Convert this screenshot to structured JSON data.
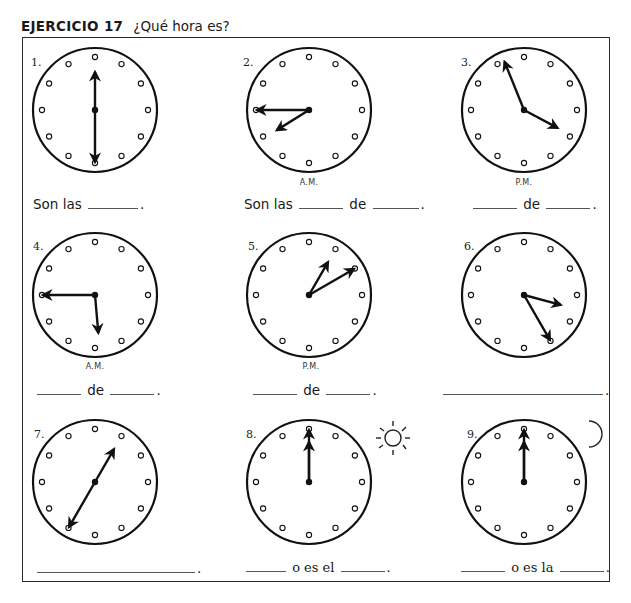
{
  "header": {
    "exercise_label": "EJERCICIO 17",
    "question": "¿Qué hora es?"
  },
  "clocks": [
    {
      "number": "1.",
      "hour_hand_deg": 0,
      "minute_hand_deg": 180,
      "period": "",
      "time_shown": "6:00",
      "answer": {
        "prefix": "Son las",
        "middle": "",
        "suffix": "."
      }
    },
    {
      "number": "2.",
      "hour_hand_deg": 238,
      "minute_hand_deg": 270,
      "period": "A.M.",
      "time_shown": "7:45",
      "answer": {
        "prefix": "Son las",
        "middle": "de",
        "suffix": "."
      }
    },
    {
      "number": "3.",
      "hour_hand_deg": 118,
      "minute_hand_deg": 338,
      "period": "P.M.",
      "time_shown": "3:55 / 4:55 region",
      "answer": {
        "prefix": "",
        "middle": "de",
        "suffix": "."
      }
    },
    {
      "number": "4.",
      "hour_hand_deg": 175,
      "minute_hand_deg": 270,
      "period": "A.M.",
      "time_shown": "5:45",
      "answer": {
        "prefix": "",
        "middle": "de",
        "suffix": "."
      }
    },
    {
      "number": "5.",
      "hour_hand_deg": 30,
      "minute_hand_deg": 60,
      "period": "P.M.",
      "time_shown": "1:10",
      "answer": {
        "prefix": "",
        "middle": "de",
        "suffix": "."
      }
    },
    {
      "number": "6.",
      "hour_hand_deg": 105,
      "minute_hand_deg": 150,
      "period": "",
      "time_shown": "3:25",
      "answer": {
        "prefix": "",
        "middle": "",
        "suffix": "."
      }
    },
    {
      "number": "7.",
      "hour_hand_deg": 30,
      "minute_hand_deg": 210,
      "period": "",
      "time_shown": "1:35",
      "answer": {
        "prefix": "",
        "middle": "",
        "suffix": "."
      }
    },
    {
      "number": "8.",
      "hour_hand_deg": 0,
      "minute_hand_deg": 0,
      "period": "",
      "time_shown": "12:00",
      "icon": "sun",
      "answer": {
        "prefix": "",
        "middle": "o es el",
        "suffix": "."
      }
    },
    {
      "number": "9.",
      "hour_hand_deg": 0,
      "minute_hand_deg": 0,
      "period": "",
      "time_shown": "12:00",
      "icon": "moon",
      "answer": {
        "prefix": "",
        "middle": "o es la",
        "suffix": "."
      }
    }
  ],
  "colors": {
    "ink": "#1a1a1a",
    "paper": "#ffffff"
  }
}
